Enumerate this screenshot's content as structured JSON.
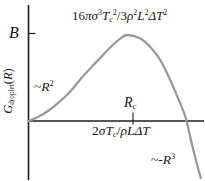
{
  "figure": {
    "background": "#ffffff",
    "axis_color": "#1c1c1c",
    "curve_color": "#9a9a9a",
    "text_color": "#161616"
  },
  "labels": {
    "y_axis": [
      {
        "text": "G",
        "kind": "i"
      },
      {
        "text": "droplet",
        "kind": "subr"
      },
      {
        "text": "(",
        "kind": "n"
      },
      {
        "text": "R",
        "kind": "i"
      },
      {
        "text": ")",
        "kind": "n"
      }
    ],
    "b_tick": [
      {
        "text": "B",
        "kind": "i"
      }
    ],
    "peak_formula": [
      {
        "text": "16",
        "kind": "n"
      },
      {
        "text": "πσ",
        "kind": "i"
      },
      {
        "text": "3",
        "kind": "sup"
      },
      {
        "text": "T",
        "kind": "i"
      },
      {
        "text": "c",
        "kind": "sub"
      },
      {
        "text": "2",
        "kind": "sup"
      },
      {
        "text": "/3",
        "kind": "n"
      },
      {
        "text": "ρ",
        "kind": "i"
      },
      {
        "text": "2",
        "kind": "sup"
      },
      {
        "text": "L",
        "kind": "i"
      },
      {
        "text": "2",
        "kind": "sup"
      },
      {
        "text": "ΔT",
        "kind": "i"
      },
      {
        "text": "2",
        "kind": "sup"
      }
    ],
    "r_squared": [
      {
        "text": "~",
        "kind": "n"
      },
      {
        "text": "R",
        "kind": "i"
      },
      {
        "text": "2",
        "kind": "sup"
      }
    ],
    "r_critical": [
      {
        "text": "R",
        "kind": "i"
      },
      {
        "text": "c",
        "kind": "sub"
      }
    ],
    "critical_radius_formula": [
      {
        "text": "2",
        "kind": "n"
      },
      {
        "text": "σT",
        "kind": "i"
      },
      {
        "text": "c",
        "kind": "sub"
      },
      {
        "text": "/",
        "kind": "n"
      },
      {
        "text": "ρLΔT",
        "kind": "i"
      }
    ],
    "r_cubed": [
      {
        "text": "~-",
        "kind": "n"
      },
      {
        "text": "R",
        "kind": "i"
      },
      {
        "text": "3",
        "kind": "sup"
      }
    ]
  },
  "chart_data": {
    "type": "line",
    "title": "",
    "xlabel": "",
    "ylabel": "G_droplet(R)",
    "x_units": "R in units of critical radius R_c",
    "y_units": "G in units of barrier height B",
    "x": [
      0,
      0.1,
      0.2,
      0.3,
      0.42,
      0.52,
      0.63,
      0.73,
      0.83,
      0.93,
      1.0,
      1.13,
      1.23,
      1.33,
      1.43,
      1.53,
      1.59,
      1.64,
      1.69,
      1.74
    ],
    "y": [
      0,
      0.05,
      0.12,
      0.21,
      0.34,
      0.48,
      0.62,
      0.74,
      0.86,
      0.96,
      1.0,
      0.96,
      0.86,
      0.71,
      0.48,
      0.21,
      0.03,
      -0.22,
      -0.45,
      -0.66
    ],
    "xlim": [
      0,
      1.78
    ],
    "ylim": [
      -0.7,
      1.15
    ],
    "x_tick": {
      "value": 1.0,
      "label": "R_c"
    },
    "y_tick": {
      "value": 1.0,
      "label": "B"
    },
    "grid": false,
    "legend": false,
    "annotations": [
      "16πσ³Tc²/3ρ²L²ΔT²",
      "2σTc/ρLΔT",
      "~R²",
      "~-R³",
      "B",
      "R_c"
    ]
  }
}
